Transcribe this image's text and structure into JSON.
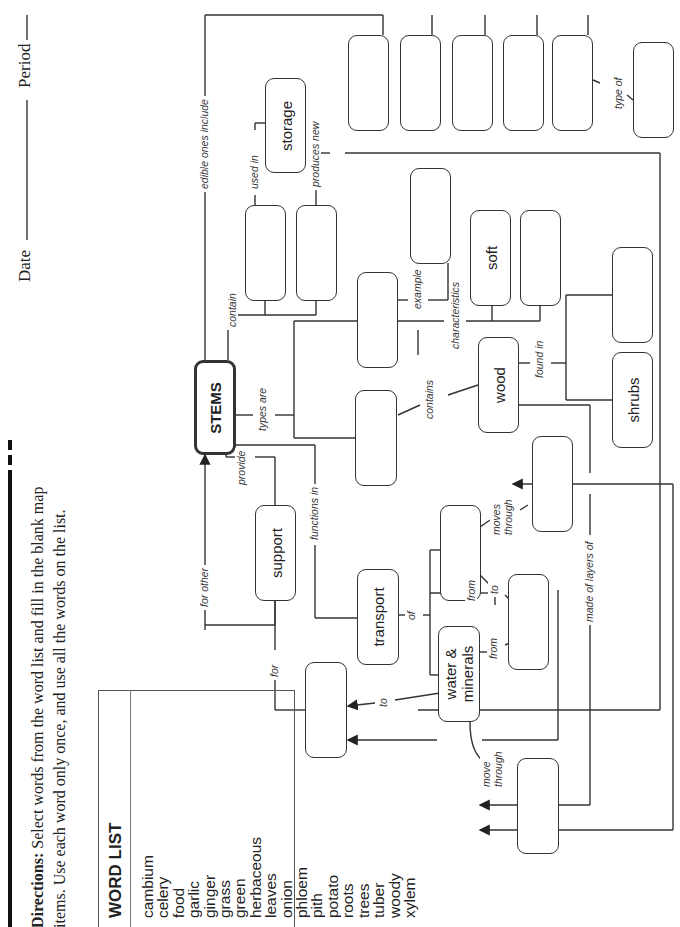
{
  "header": {
    "date_label": "Date",
    "period_label": "Period",
    "directions_bold": "Directions:",
    "directions_line1": "Select words from the word list and fill in the blank map",
    "directions_line2": "items. Use each word only once, and use all the words on the list."
  },
  "word_list": {
    "title": "WORD LIST",
    "words": [
      "cambium",
      "celery",
      "food",
      "garlic",
      "ginger",
      "grass",
      "green",
      "herbaceous",
      "leaves",
      "onion",
      "phloem",
      "pith",
      "potato",
      "roots",
      "trees",
      "tuber",
      "woody",
      "xylem"
    ]
  },
  "concept_map": {
    "nodes": {
      "stems": "STEMS",
      "storage": "storage",
      "soft": "soft",
      "wood": "wood",
      "shrubs": "shrubs",
      "support": "support",
      "transport": "transport",
      "water_minerals_1": "water &",
      "water_minerals_2": "minerals",
      "blank": ""
    },
    "links": {
      "edible_ones_include": "edible ones include",
      "used_in": "used in",
      "produces_new": "produces new",
      "type_of": "type of",
      "contain": "contain",
      "example": "example",
      "characteristics": "characteristics",
      "types_are": "types are",
      "contains": "contains",
      "found_in": "found in",
      "provide": "provide",
      "for_other": "for other",
      "functions_in": "functions in",
      "moves_through": "moves",
      "moves_through2": "through",
      "from": "from",
      "to": "to",
      "of": "of",
      "for": "for",
      "made_of_layers_of": "made of layers of",
      "move": "move",
      "through": "through"
    }
  }
}
